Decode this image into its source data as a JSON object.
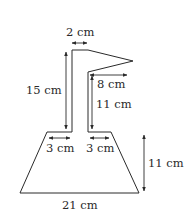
{
  "diagram": {
    "shape": "Composite shape: a trapezium base with a vertical stem and triangular flag",
    "labels": {
      "stem_width": "2 cm",
      "flag_width": "8 cm",
      "stem_height_left": "15 cm",
      "stem_height_inner": "11 cm",
      "base_left_ledge": "3 cm",
      "base_right_ledge": "3 cm",
      "trapezium_height": "11 cm",
      "trapezium_base": "21 cm"
    },
    "colors": {
      "line": "#2a2a2a",
      "fill": "#ffffff"
    }
  }
}
